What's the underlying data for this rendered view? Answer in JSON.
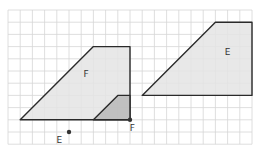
{
  "colors": {
    "grid": "#d6d6d6",
    "shape_fill": "#e4e4e4",
    "small_shape_fill": "#b9b9b9",
    "outline": "#2a2a2a",
    "point": "#333333"
  },
  "grid": {
    "columns": 20,
    "rows": 11
  },
  "shapes": [
    {
      "label": "F",
      "name": "shape-f",
      "vertices": [
        [
          1,
          9
        ],
        [
          7,
          3
        ],
        [
          10,
          3
        ],
        [
          10,
          9
        ]
      ],
      "label_at": [
        6.4,
        5.5
      ],
      "fill": "shape_fill"
    },
    {
      "label": "",
      "name": "shape-f-small",
      "vertices": [
        [
          7,
          9
        ],
        [
          9,
          7
        ],
        [
          10,
          7
        ],
        [
          10,
          9
        ]
      ],
      "fill": "small_shape_fill"
    },
    {
      "label": "E",
      "name": "shape-e",
      "vertices": [
        [
          11,
          7
        ],
        [
          17,
          1
        ],
        [
          20,
          1
        ],
        [
          20,
          7
        ]
      ],
      "label_at": [
        18,
        3.7
      ],
      "fill": "shape_fill"
    }
  ],
  "points": [
    {
      "label": "E",
      "name": "point-e",
      "at": [
        5,
        10
      ],
      "label_offset": [
        -0.8,
        0.9
      ]
    },
    {
      "label": "F",
      "name": "point-f",
      "at": [
        10,
        9
      ],
      "label_offset": [
        0.2,
        0.9
      ]
    }
  ]
}
